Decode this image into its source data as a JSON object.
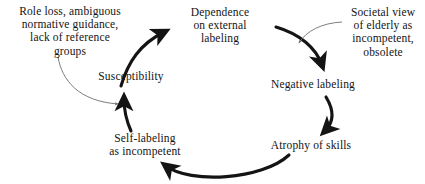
{
  "diagram": {
    "type": "cyclical-feedback-loop",
    "background_color": "#ffffff",
    "ink_color": "#141414",
    "annotation_line_color": "#6e6e6e",
    "nodes": [
      {
        "id": "dependence",
        "lines": [
          "Dependence",
          "on external",
          "labeling"
        ]
      },
      {
        "id": "negative_labeling",
        "lines": [
          "Negative labeling"
        ]
      },
      {
        "id": "atrophy",
        "lines": [
          "Atrophy of skills"
        ]
      },
      {
        "id": "self_labeling",
        "lines": [
          "Self-labeling",
          "as incompetent"
        ]
      },
      {
        "id": "susceptibility",
        "lines": [
          "Susceptibility"
        ]
      }
    ],
    "annotations": [
      {
        "id": "role_loss",
        "lines": [
          "Role loss, ambiguous",
          "normative guidance,",
          "lack of reference",
          "groups"
        ],
        "points_to": "self_labeling_to_susceptibility_arrow"
      },
      {
        "id": "societal_view",
        "lines": [
          "Societal view",
          "of elderly as",
          "incompetent,",
          "obsolete"
        ],
        "points_to": "dependence_to_negative_labeling_arrow"
      }
    ],
    "edges": [
      {
        "from": "susceptibility",
        "to": "dependence",
        "style": "thick-curved-arrow"
      },
      {
        "from": "dependence",
        "to": "negative_labeling",
        "style": "thick-curved-arrow"
      },
      {
        "from": "negative_labeling",
        "to": "atrophy",
        "style": "thick-curved-arrow"
      },
      {
        "from": "atrophy",
        "to": "self_labeling",
        "style": "thick-curved-arrow"
      },
      {
        "from": "self_labeling",
        "to": "susceptibility",
        "style": "thick-curved-arrow"
      }
    ]
  }
}
